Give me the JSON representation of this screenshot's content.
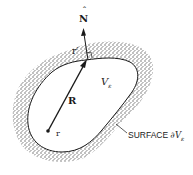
{
  "diagram": {
    "labels": {
      "normal": "N",
      "normal_accent": "ˆ",
      "surface_point": "r′",
      "volume": "V",
      "volume_sub": "ε",
      "vector": "R",
      "origin_point": "r",
      "surface_prefix": "SURFACE ",
      "surface_symbol": "∂V",
      "surface_sub": "ε"
    },
    "colors": {
      "ink": "#1a1a1a",
      "shading": "#7a7a7a",
      "background": "#ffffff"
    }
  }
}
